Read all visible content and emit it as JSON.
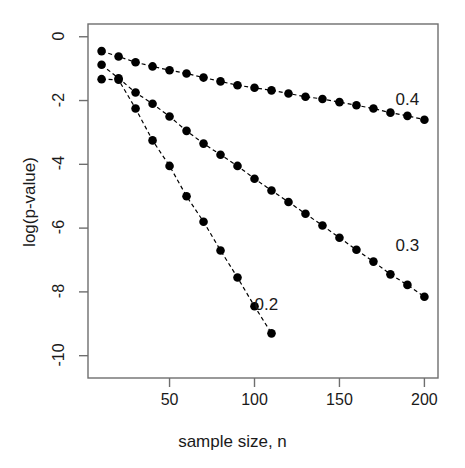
{
  "chart_data": {
    "type": "line",
    "title": "",
    "xlabel": "sample size, n",
    "ylabel": "log(p-value)",
    "xlim": [
      2,
      208
    ],
    "ylim": [
      -10.7,
      0.4
    ],
    "grid": false,
    "legend_position": "inline-right-of-curve",
    "xticks": [
      50,
      100,
      150,
      200
    ],
    "yticks": [
      0,
      -2,
      -4,
      -6,
      -8,
      -10
    ],
    "xtick_labels": [
      "50",
      "100",
      "150",
      "200"
    ],
    "ytick_labels": [
      "0",
      "-2",
      "-4",
      "-6",
      "-8",
      "-10"
    ],
    "marker": "filled-circle",
    "linestyle": "dashed",
    "color": "#000000",
    "series": [
      {
        "name": "0.4",
        "label": "0.4",
        "label_x": 183,
        "label_y": -2.0,
        "x": [
          10,
          20,
          30,
          40,
          50,
          60,
          70,
          80,
          90,
          100,
          110,
          120,
          130,
          140,
          150,
          160,
          170,
          180,
          190,
          200
        ],
        "values": [
          -0.45,
          -0.62,
          -0.8,
          -0.93,
          -1.05,
          -1.15,
          -1.28,
          -1.4,
          -1.52,
          -1.6,
          -1.68,
          -1.78,
          -1.88,
          -1.95,
          -2.05,
          -2.15,
          -2.25,
          -2.38,
          -2.48,
          -2.6
        ]
      },
      {
        "name": "0.3",
        "label": "0.3",
        "label_x": 183,
        "label_y": -6.6,
        "x": [
          10,
          20,
          30,
          40,
          50,
          60,
          70,
          80,
          90,
          100,
          110,
          120,
          130,
          140,
          150,
          160,
          170,
          180,
          190,
          200
        ],
        "values": [
          -0.88,
          -1.3,
          -1.75,
          -2.1,
          -2.5,
          -2.95,
          -3.35,
          -3.7,
          -4.05,
          -4.45,
          -4.82,
          -5.18,
          -5.55,
          -5.92,
          -6.3,
          -6.68,
          -7.05,
          -7.45,
          -7.78,
          -8.15
        ]
      },
      {
        "name": "0.2",
        "label": "0.2",
        "label_x": 100,
        "label_y": -8.45,
        "x": [
          10,
          20,
          30,
          40,
          50,
          60,
          70,
          80,
          90,
          100,
          110
        ],
        "values": [
          -1.33,
          -1.35,
          -2.25,
          -3.25,
          -4.05,
          -5.0,
          -5.8,
          -6.7,
          -7.55,
          -8.45,
          -9.3
        ]
      }
    ]
  }
}
